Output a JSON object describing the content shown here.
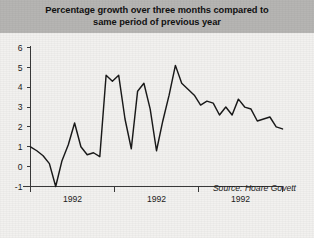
{
  "figure": {
    "title": "Percentage growth over three months compared to\nsame period of previous year",
    "source_note": "Source: Hoare Govett",
    "background_color": "#f2f1ef",
    "title_band_color": "#b6b5b3",
    "line_color": "#1a1a1a",
    "axis_color": "#3a3a3a"
  },
  "chart_data": {
    "type": "line",
    "title": "Percentage growth over three months compared to same period of previous year",
    "xlabel": "",
    "ylabel": "",
    "ylim": [
      -1,
      6
    ],
    "yticks": [
      -1,
      0,
      1,
      2,
      3,
      4,
      5,
      6
    ],
    "ytick_labels": [
      "-1",
      "0",
      "1",
      "2",
      "3",
      "4",
      "5",
      "6"
    ],
    "xticks": [
      0,
      33.3,
      66.7,
      100
    ],
    "xtick_labels": [
      "",
      "",
      "",
      ""
    ],
    "x_axis_annotations": [
      "1992",
      "1992",
      "1992"
    ],
    "grid": false,
    "legend": "none",
    "annotations": [
      "Source: Hoare Govett"
    ],
    "series": [
      {
        "name": "Percentage growth",
        "x": [
          0,
          2.5,
          5,
          7.5,
          10,
          12.5,
          15,
          17.5,
          20,
          22.5,
          25,
          27.5,
          30,
          32.5,
          35,
          37.5,
          40,
          42.5,
          45,
          47.5,
          50,
          52.5,
          55,
          57.5,
          60,
          62.5,
          65,
          67.5,
          70,
          72.5,
          75,
          77.5,
          80,
          82.5,
          85,
          87.5,
          90,
          92.5,
          95,
          97.5,
          100
        ],
        "values": [
          1.0,
          0.8,
          0.55,
          0.15,
          -1.0,
          0.3,
          1.1,
          2.2,
          1.0,
          0.6,
          0.7,
          0.5,
          4.6,
          4.3,
          4.6,
          2.4,
          0.9,
          3.8,
          4.2,
          2.9,
          0.8,
          2.3,
          3.6,
          5.1,
          4.2,
          3.9,
          3.6,
          3.1,
          3.3,
          3.2,
          2.6,
          3.0,
          2.6,
          3.4,
          3.0,
          2.9,
          2.3,
          2.4,
          2.5,
          2.0,
          1.9
        ]
      }
    ]
  }
}
